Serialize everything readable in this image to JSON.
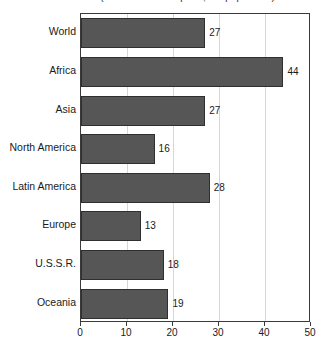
{
  "chart_data": {
    "type": "bar",
    "orientation": "horizontal",
    "title": "(Number of births per 1,000 population)",
    "xlabel": "",
    "ylabel": "",
    "xlim": [
      0,
      50
    ],
    "xticks": [
      0,
      10,
      20,
      30,
      40,
      50
    ],
    "grid": true,
    "grid_axis": "x",
    "legend": false,
    "bar_color": "#565656",
    "bar_edge_color": "#2f2f2f",
    "gridline_color": "#d6d6d6",
    "axis_color": "#3a3a3a",
    "background": "#ffffff",
    "categories": [
      "World",
      "Africa",
      "Asia",
      "North America",
      "Latin America",
      "Europe",
      "U.S.S.R.",
      "Oceania"
    ],
    "values": [
      27,
      44,
      27,
      16,
      28,
      13,
      18,
      19
    ],
    "value_labels": [
      "27",
      "44",
      "27",
      "16",
      "28",
      "13",
      "18",
      "19"
    ],
    "xtick_labels": [
      "0",
      "10",
      "20",
      "30",
      "40",
      "50"
    ]
  }
}
